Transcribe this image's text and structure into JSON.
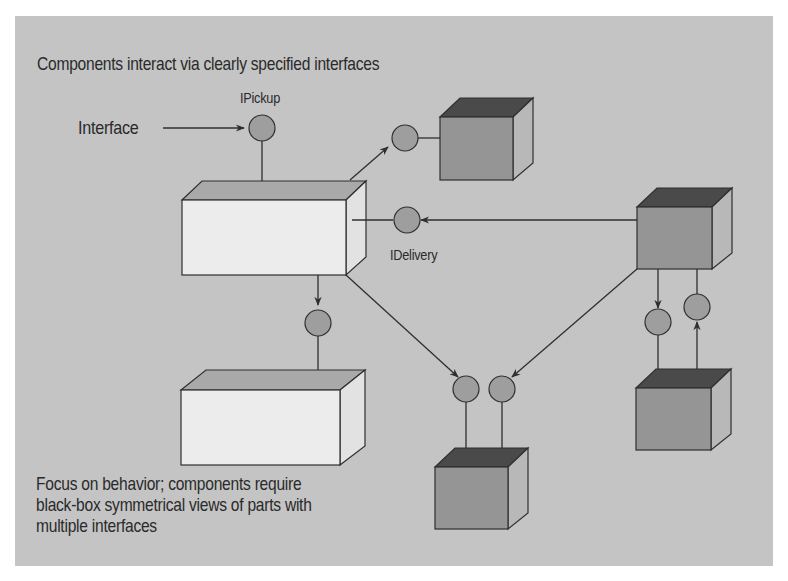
{
  "diagram": {
    "title": "Components interact via clearly specified interfaces",
    "labels": {
      "interface": "Interface",
      "ipickup": "IPickup",
      "idelivery": "IDelivery"
    },
    "footer_lines": [
      "Focus on behavior; components require",
      "black-box symmetrical views of parts with",
      "multiple interfaces"
    ],
    "colors": {
      "background": "#c4c4c4",
      "white_box_front": "#ececec",
      "white_box_top": "#a9a9a9",
      "white_box_side": "#e2e2e2",
      "cube_front": "#959595",
      "cube_top": "#4a4a4a",
      "cube_side": "#b8b8b8",
      "interface_circle": "#9e9e9e",
      "stroke": "#2f2f2f"
    },
    "nodes": [
      {
        "id": "main-component",
        "shape": "white-box"
      },
      {
        "id": "lower-component",
        "shape": "white-box"
      },
      {
        "id": "top-right-cube",
        "shape": "cube"
      },
      {
        "id": "right-cube",
        "shape": "cube"
      },
      {
        "id": "bottom-center-cube",
        "shape": "cube"
      },
      {
        "id": "bottom-right-cube",
        "shape": "cube"
      }
    ],
    "interfaces": [
      "IPickup",
      "IDelivery"
    ]
  }
}
